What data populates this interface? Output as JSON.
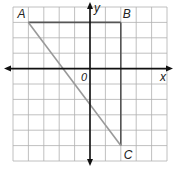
{
  "diagram": {
    "type": "coordinate-grid",
    "grid": {
      "x_min": -5,
      "x_max": 5,
      "y_min": -6,
      "y_max": 4,
      "step": 1
    },
    "axes": {
      "x_label": "x",
      "y_label": "y",
      "origin_label": "0"
    },
    "points": [
      {
        "name": "A",
        "x": -4,
        "y": 3
      },
      {
        "name": "B",
        "x": 2,
        "y": 3
      },
      {
        "name": "C",
        "x": 2,
        "y": -5
      }
    ],
    "segments": [
      {
        "from": "A",
        "to": "B",
        "color": "#555555"
      },
      {
        "from": "B",
        "to": "C",
        "color": "#555555"
      },
      {
        "from": "A",
        "to": "C",
        "color": "#9a9a9a"
      }
    ],
    "colors": {
      "grid": "#b0b0b0",
      "axis": "#111111"
    }
  }
}
